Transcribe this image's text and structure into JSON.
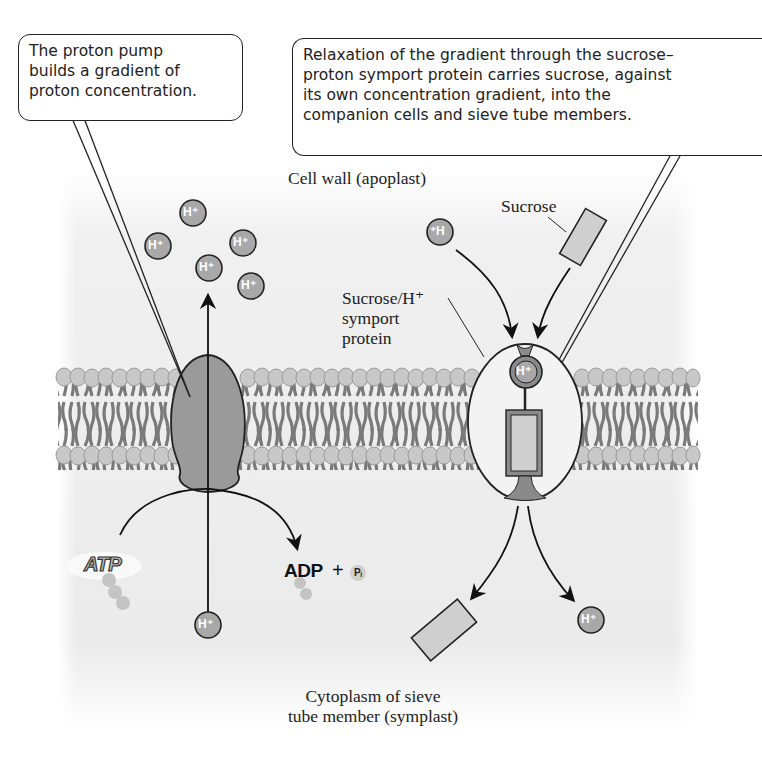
{
  "diagram": {
    "colors": {
      "background_fill": "#ececec",
      "membrane_head": "#c8c8c8",
      "membrane_tail": "#7a7a7a",
      "pump_fill": "#9a9a9a",
      "proton_fill": "#a8a8a8",
      "sucrose_fill": "#cfcfcf",
      "outline": "#222222"
    },
    "callouts": [
      {
        "id": "proton-pump-callout",
        "lines": [
          "The proton pump",
          "builds a gradient of",
          "proton concentration."
        ]
      },
      {
        "id": "symport-callout",
        "lines": [
          "Relaxation of the gradient through the sucrose–",
          "proton symport protein carries sucrose, against",
          "its own concentration gradient, into the",
          "companion cells and sieve tube members."
        ]
      }
    ],
    "labels": {
      "cell_wall": "Cell wall (apoplast)",
      "sucrose": "Sucrose",
      "symport_protein": [
        "Sucrose/H⁺",
        "symport",
        "protein"
      ],
      "cytoplasm": [
        "Cytoplasm of sieve",
        "tube member (symplast)"
      ]
    },
    "molecules": {
      "proton_label": "H⁺",
      "proton_label_mirrored": "⁺H",
      "atp": "ATP",
      "adp": "ADP",
      "plus": "+",
      "pi": "Pᵢ"
    },
    "regions": [
      "Cell wall (apoplast)",
      "Plasma membrane",
      "Cytoplasm of sieve tube member (symplast)"
    ],
    "components": [
      "Proton pump (H⁺-ATPase)",
      "Sucrose/H⁺ symport protein"
    ]
  }
}
